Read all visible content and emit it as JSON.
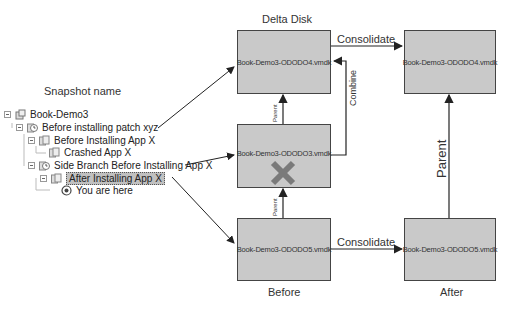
{
  "labels": {
    "snapshot_name": "Snapshot name",
    "delta_disk": "Delta Disk",
    "before": "Before",
    "after": "After"
  },
  "tree": {
    "nodes": [
      {
        "label": "Book-Demo3",
        "icon": "vm-icon",
        "level": 0,
        "toggle": true
      },
      {
        "label": "Before installing patch xyz",
        "icon": "snapshot-clock-icon",
        "level": 1,
        "toggle": true
      },
      {
        "label": "Before Installing App X",
        "icon": "snapshot-icon",
        "level": 2,
        "toggle": true
      },
      {
        "label": "Crashed App X",
        "icon": "snapshot-icon",
        "level": 3,
        "toggle": false
      },
      {
        "label": "Side Branch Before Installing App X",
        "icon": "snapshot-clock-icon",
        "level": 2,
        "toggle": true
      },
      {
        "label": "After Installing App X",
        "icon": "snapshot-icon",
        "level": 3,
        "toggle": true,
        "selected": true
      },
      {
        "label": "You are here",
        "icon": "you-are-here-icon",
        "level": 4,
        "toggle": false
      }
    ]
  },
  "disks": {
    "top_left": "Book-Demo3-ODODO4.vmdk",
    "middle": "Book-Demo3-ODODO3.vmdk",
    "bottom_left": "Book-Demo3-ODODO5.vmdk",
    "top_right": "Book-Demo3-ODODO4.vmdk",
    "bottom_right": "Book-Demo3-ODODO5.vmdk"
  },
  "edges": {
    "consolidate_top": "Consolidate",
    "consolidate_bottom": "Consolidate",
    "combine": "Combine",
    "parent_upper": "Parent",
    "parent_lower": "Parent",
    "parent_right": "Parent"
  },
  "colors": {
    "box_fill": "#c9c9c9",
    "box_border": "#444444",
    "delete_mark": "#808080",
    "arrow": "#222222"
  }
}
